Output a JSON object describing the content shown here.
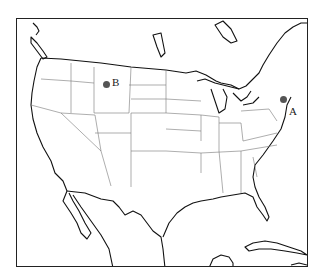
{
  "map": {
    "title": "",
    "region": "United States (contiguous)",
    "style": "outline map with state boundaries",
    "markers": [
      {
        "id": "A",
        "label": "A",
        "location": "Northeast coast (New York City area)",
        "color": "#555555",
        "x": 282,
        "y": 98,
        "label_x": 288,
        "label_y": 103
      },
      {
        "id": "B",
        "label": "B",
        "location": "Montana",
        "color": "#555555",
        "x": 105,
        "y": 83,
        "label_x": 110,
        "label_y": 76
      }
    ]
  }
}
